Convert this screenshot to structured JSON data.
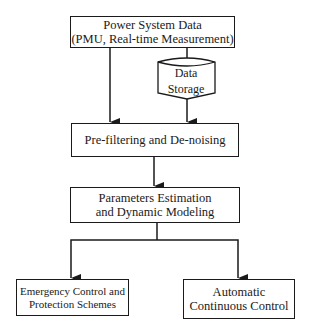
{
  "diagram": {
    "nodes": {
      "power_data": {
        "line1": "Power System Data",
        "line2": "(PMU, Real-time Measurement)"
      },
      "storage": {
        "line1": "Data",
        "line2": "Storage"
      },
      "prefilter": {
        "line1": "Pre-filtering and De-noising"
      },
      "params": {
        "line1": "Parameters Estimation",
        "line2": "and Dynamic Modeling"
      },
      "emergency": {
        "line1": "Emergency Control and",
        "line2": "Protection Schemes"
      },
      "automatic": {
        "line1": "Automatic",
        "line2": "Continuous Control"
      }
    },
    "edges": [
      {
        "from": "power_data",
        "to": "prefilter"
      },
      {
        "from": "power_data",
        "to": "storage"
      },
      {
        "from": "storage",
        "to": "prefilter"
      },
      {
        "from": "prefilter",
        "to": "params"
      },
      {
        "from": "params",
        "to": "emergency"
      },
      {
        "from": "params",
        "to": "automatic"
      }
    ]
  }
}
